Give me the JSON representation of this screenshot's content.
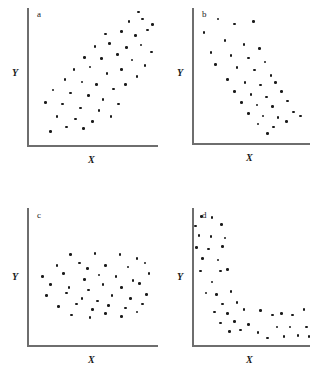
{
  "figure": {
    "width": 334,
    "height": 385,
    "background": "#ffffff",
    "point_color": "#1a1a1a",
    "axis_color": "#6e6e6e",
    "text_color": "#1a1a1a"
  },
  "chart_data": [
    {
      "type": "scatter",
      "panel": "a",
      "label": "a",
      "title": "",
      "xlabel": "X",
      "ylabel": "Y",
      "relationship": "strong positive linear correlation",
      "grid": false,
      "legend": "none",
      "xlim": [
        0,
        100
      ],
      "ylim": [
        0,
        100
      ],
      "axes_px": {
        "x0": 27,
        "y0": 145,
        "x1": 158,
        "y1": 8
      },
      "points": [
        [
          18,
          10
        ],
        [
          30,
          13
        ],
        [
          43,
          12
        ],
        [
          23,
          21
        ],
        [
          37,
          19
        ],
        [
          50,
          17
        ],
        [
          14,
          31
        ],
        [
          27,
          30
        ],
        [
          41,
          27
        ],
        [
          55,
          25
        ],
        [
          64,
          21
        ],
        [
          20,
          40
        ],
        [
          33,
          38
        ],
        [
          47,
          36
        ],
        [
          58,
          33
        ],
        [
          70,
          30
        ],
        [
          29,
          48
        ],
        [
          42,
          46
        ],
        [
          53,
          44
        ],
        [
          66,
          41
        ],
        [
          75,
          44
        ],
        [
          36,
          55
        ],
        [
          48,
          57
        ],
        [
          61,
          52
        ],
        [
          72,
          55
        ],
        [
          84,
          50
        ],
        [
          44,
          64
        ],
        [
          57,
          63
        ],
        [
          69,
          66
        ],
        [
          80,
          62
        ],
        [
          90,
          58
        ],
        [
          52,
          72
        ],
        [
          63,
          74
        ],
        [
          76,
          71
        ],
        [
          87,
          73
        ],
        [
          95,
          68
        ],
        [
          60,
          81
        ],
        [
          72,
          83
        ],
        [
          83,
          80
        ],
        [
          92,
          84
        ],
        [
          78,
          90
        ],
        [
          88,
          92
        ],
        [
          96,
          88
        ],
        [
          85,
          97
        ]
      ]
    },
    {
      "type": "scatter",
      "panel": "b",
      "label": "b",
      "title": "",
      "xlabel": "X",
      "ylabel": "Y",
      "relationship": "strong negative linear correlation",
      "grid": false,
      "legend": "none",
      "xlim": [
        0,
        100
      ],
      "ylim": [
        0,
        100
      ],
      "axes_px": {
        "x0": 192,
        "y0": 143,
        "x1": 310,
        "y1": 8
      },
      "points": [
        [
          22,
          92
        ],
        [
          36,
          88
        ],
        [
          52,
          90
        ],
        [
          10,
          82
        ],
        [
          28,
          76
        ],
        [
          44,
          73
        ],
        [
          57,
          70
        ],
        [
          16,
          67
        ],
        [
          33,
          65
        ],
        [
          48,
          63
        ],
        [
          62,
          60
        ],
        [
          20,
          58
        ],
        [
          38,
          56
        ],
        [
          53,
          54
        ],
        [
          67,
          50
        ],
        [
          30,
          47
        ],
        [
          45,
          45
        ],
        [
          58,
          43
        ],
        [
          71,
          45
        ],
        [
          36,
          38
        ],
        [
          50,
          36
        ],
        [
          63,
          34
        ],
        [
          76,
          38
        ],
        [
          42,
          30
        ],
        [
          55,
          28
        ],
        [
          68,
          27
        ],
        [
          81,
          31
        ],
        [
          48,
          22
        ],
        [
          60,
          20
        ],
        [
          73,
          19
        ],
        [
          86,
          23
        ],
        [
          56,
          14
        ],
        [
          69,
          12
        ],
        [
          80,
          16
        ],
        [
          92,
          20
        ],
        [
          64,
          7
        ]
      ]
    },
    {
      "type": "scatter",
      "panel": "c",
      "label": "c",
      "title": "",
      "xlabel": "X",
      "ylabel": "Y",
      "relationship": "no correlation (random cloud)",
      "grid": false,
      "legend": "none",
      "xlim": [
        0,
        100
      ],
      "ylim": [
        0,
        100
      ],
      "axes_px": {
        "x0": 27,
        "y0": 345,
        "x1": 158,
        "y1": 208
      },
      "points": [
        [
          33,
          66
        ],
        [
          52,
          67
        ],
        [
          71,
          66
        ],
        [
          84,
          63
        ],
        [
          23,
          58
        ],
        [
          40,
          60
        ],
        [
          46,
          56
        ],
        [
          60,
          58
        ],
        [
          77,
          57
        ],
        [
          90,
          60
        ],
        [
          12,
          50
        ],
        [
          28,
          52
        ],
        [
          44,
          48
        ],
        [
          55,
          51
        ],
        [
          68,
          50
        ],
        [
          81,
          47
        ],
        [
          93,
          52
        ],
        [
          18,
          44
        ],
        [
          32,
          42
        ],
        [
          47,
          40
        ],
        [
          58,
          44
        ],
        [
          72,
          42
        ],
        [
          86,
          45
        ],
        [
          15,
          36
        ],
        [
          30,
          38
        ],
        [
          42,
          34
        ],
        [
          54,
          32
        ],
        [
          65,
          36
        ],
        [
          79,
          34
        ],
        [
          91,
          37
        ],
        [
          24,
          28
        ],
        [
          38,
          30
        ],
        [
          50,
          26
        ],
        [
          62,
          29
        ],
        [
          75,
          27
        ],
        [
          88,
          30
        ],
        [
          34,
          22
        ],
        [
          48,
          20
        ],
        [
          60,
          23
        ],
        [
          72,
          21
        ],
        [
          84,
          24
        ]
      ]
    },
    {
      "type": "scatter",
      "panel": "d",
      "label": "d",
      "title": "",
      "xlabel": "X",
      "ylabel": "Y",
      "relationship": "curvilinear negative (exponential decay)",
      "grid": false,
      "legend": "none",
      "xlim": [
        0,
        100
      ],
      "ylim": [
        0,
        100
      ],
      "axes_px": {
        "x0": 192,
        "y0": 345,
        "x1": 310,
        "y1": 208
      },
      "points": [
        [
          8,
          94
        ],
        [
          17,
          93
        ],
        [
          3,
          87
        ],
        [
          25,
          88
        ],
        [
          6,
          80
        ],
        [
          16,
          79
        ],
        [
          28,
          78
        ],
        [
          4,
          71
        ],
        [
          14,
          70
        ],
        [
          26,
          72
        ],
        [
          9,
          63
        ],
        [
          22,
          62
        ],
        [
          7,
          54
        ],
        [
          24,
          54
        ],
        [
          30,
          55
        ],
        [
          17,
          46
        ],
        [
          12,
          38
        ],
        [
          21,
          37
        ],
        [
          33,
          39
        ],
        [
          26,
          30
        ],
        [
          38,
          31
        ],
        [
          19,
          24
        ],
        [
          30,
          23
        ],
        [
          44,
          26
        ],
        [
          58,
          25
        ],
        [
          24,
          16
        ],
        [
          36,
          17
        ],
        [
          48,
          15
        ],
        [
          68,
          22
        ],
        [
          76,
          23
        ],
        [
          85,
          22
        ],
        [
          32,
          10
        ],
        [
          41,
          11
        ],
        [
          56,
          9
        ],
        [
          72,
          13
        ],
        [
          83,
          13
        ],
        [
          95,
          26
        ],
        [
          64,
          5
        ],
        [
          78,
          6
        ],
        [
          90,
          7
        ],
        [
          97,
          13
        ],
        [
          99,
          6
        ]
      ]
    }
  ]
}
